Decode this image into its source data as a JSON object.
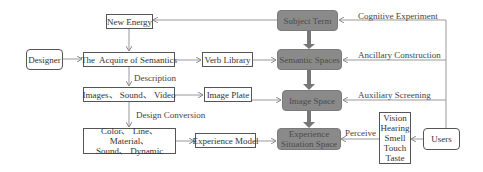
{
  "diagram": {
    "nodes": {
      "new_energy": "New Energy",
      "designer": "Designer",
      "acquire_semantics": "The  Acquire of Semantics",
      "verb_library": "Verb Library",
      "subject_term": "Subject Term",
      "semantic_spaces": "Semantic Spaces",
      "images_sound_video": "Images、 Sound、 Video",
      "image_plate": "Image Plate",
      "image_space": "Image Space",
      "color_line_1": "Color、 Line、 Material、",
      "color_line_2": "Sound、 Dynamic",
      "experience_model": "Experience Model",
      "experience_situation_1": "Experience",
      "experience_situation_2": "Situation Space",
      "senses": [
        "Vision",
        "Hearing",
        "Smell",
        "Touch",
        "Taste"
      ],
      "users": "Users"
    },
    "edge_labels": {
      "description": "Description",
      "design_conversion": "Design Conversion",
      "cognitive_experiment": "Cognitive Experiment",
      "ancillary_construction": "Ancillary Construction",
      "auxiliary_screening": "Auxiliary Screening",
      "perceive": "Perceive"
    },
    "colors": {
      "dark_node_fill": "#8a8a8a",
      "dark_node_text": "#4a4a4a",
      "line": "#888888",
      "thick_arrow": "#777777"
    }
  }
}
